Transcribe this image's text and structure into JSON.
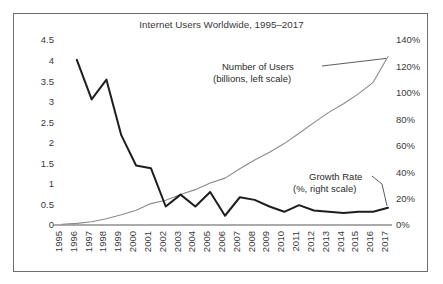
{
  "figure": {
    "title": "Internet Users Worldwide, 1995–2017",
    "frame_color": "#6e6e72",
    "background": "#ffffff"
  },
  "annotations": {
    "users": {
      "line1": "Number of Users",
      "line2": "(billions, left scale)"
    },
    "growth": {
      "line1": "Growth Rate",
      "line2": "(%, right scale)"
    }
  },
  "chart_data": {
    "type": "line",
    "title": "Internet Users Worldwide, 1995–2017",
    "xlabel": "",
    "grid": false,
    "legend_position": "inline-annotations",
    "categories": [
      "1995",
      "1996",
      "1997",
      "1998",
      "1999",
      "2000",
      "2001",
      "2002",
      "2003",
      "2004",
      "2005",
      "2006",
      "2007",
      "2008",
      "2009",
      "2010",
      "2011",
      "2012",
      "2013",
      "2014",
      "2015",
      "2016",
      "2017"
    ],
    "axes": {
      "left": {
        "label": "Number of Users (billions)",
        "ylim": [
          0,
          4.5
        ],
        "ticks": [
          0,
          0.5,
          1,
          1.5,
          2,
          2.5,
          3,
          3.5,
          4,
          4.5
        ],
        "tick_labels": [
          "0",
          "0.5",
          "1",
          "1.5",
          "2",
          "2.5",
          "3",
          "3.5",
          "4",
          "4.5"
        ]
      },
      "right": {
        "label": "Growth Rate (%)",
        "ylim": [
          0,
          140
        ],
        "ticks": [
          0,
          20,
          40,
          60,
          80,
          100,
          120,
          140
        ],
        "tick_labels": [
          "0%",
          "20%",
          "40%",
          "60%",
          "80%",
          "100%",
          "120%",
          "140%"
        ]
      }
    },
    "series": [
      {
        "name": "Number of Users",
        "axis": "left",
        "unit": "billions",
        "color": "#8a8a8e",
        "width": 1.1,
        "values": [
          0.02,
          0.04,
          0.08,
          0.15,
          0.25,
          0.36,
          0.52,
          0.6,
          0.74,
          0.86,
          1.02,
          1.14,
          1.37,
          1.58,
          1.77,
          1.98,
          2.23,
          2.49,
          2.74,
          2.95,
          3.19,
          3.47,
          4.1
        ]
      },
      {
        "name": "Growth Rate",
        "axis": "right",
        "unit": "%",
        "color": "#1e1e1e",
        "width": 2.0,
        "values": [
          null,
          125,
          95,
          110,
          68,
          45,
          43,
          14,
          23,
          14,
          25,
          7,
          21,
          19,
          14,
          10,
          15,
          11,
          10,
          9,
          10,
          10,
          13
        ]
      }
    ]
  }
}
